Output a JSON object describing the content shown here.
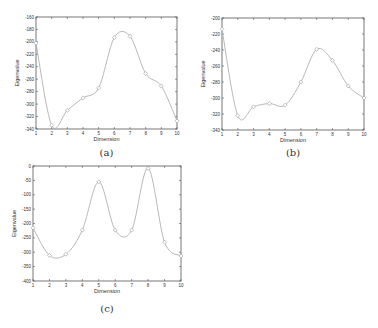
{
  "chart_data": [
    {
      "id": "a",
      "type": "line",
      "caption": "(a)",
      "title": "",
      "xlabel": "Dimension",
      "ylabel": "Eigenvalue",
      "x": [
        1,
        2,
        3,
        4,
        5,
        6,
        7,
        8,
        9,
        10
      ],
      "values": [
        -202,
        -334,
        -310,
        -290,
        -274,
        -193,
        -191,
        -251,
        -271,
        -327
      ],
      "xlim": [
        1,
        10
      ],
      "ylim": [
        -340,
        -160
      ],
      "xticks": [
        1,
        2,
        3,
        4,
        5,
        6,
        7,
        8,
        9,
        10
      ],
      "yticks": [
        -160,
        -180,
        -200,
        -220,
        -240,
        -260,
        -280,
        -300,
        -320,
        -340
      ],
      "grid": false,
      "smooth": true,
      "marker": "diamond"
    },
    {
      "id": "b",
      "type": "line",
      "caption": "(b)",
      "title": "",
      "xlabel": "Dimension",
      "ylabel": "Eigenvalue",
      "x": [
        1,
        2,
        3,
        4,
        5,
        6,
        7,
        8,
        9,
        10
      ],
      "values": [
        -214,
        -322,
        -311,
        -307,
        -309,
        -280,
        -239,
        -253,
        -285,
        -300
      ],
      "xlim": [
        1,
        10
      ],
      "ylim": [
        -340,
        -200
      ],
      "xticks": [
        1,
        2,
        3,
        4,
        5,
        6,
        7,
        8,
        9,
        10
      ],
      "yticks": [
        -200,
        -220,
        -240,
        -260,
        -280,
        -300,
        -320,
        -340
      ],
      "grid": false,
      "smooth": true,
      "marker": "diamond"
    },
    {
      "id": "c",
      "type": "line",
      "caption": "(c)",
      "title": "",
      "xlabel": "Dimension",
      "ylabel": "Eigenvalue",
      "x": [
        1,
        2,
        3,
        4,
        5,
        6,
        7,
        8,
        9,
        10
      ],
      "values": [
        -215,
        -311,
        -307,
        -223,
        -55,
        -223,
        -223,
        -8,
        -265,
        -313
      ],
      "xlim": [
        1,
        10
      ],
      "ylim": [
        -400,
        0
      ],
      "xticks": [
        1,
        2,
        3,
        4,
        5,
        6,
        7,
        8,
        9,
        10
      ],
      "yticks": [
        0,
        -50,
        -100,
        -150,
        -200,
        -250,
        -300,
        -350,
        -400
      ],
      "grid": false,
      "smooth": true,
      "marker": "diamond"
    }
  ],
  "layout": {
    "panels": [
      {
        "left": 36,
        "top": 17,
        "right": 177,
        "bottom": 129,
        "caption_y": 156
      },
      {
        "left": 222,
        "top": 18,
        "right": 364,
        "bottom": 130,
        "caption_y": 156
      },
      {
        "left": 33,
        "top": 166,
        "right": 181,
        "bottom": 281,
        "caption_y": 312
      }
    ],
    "colors": {
      "axis": "#555555",
      "line": "#b0b0b0",
      "marker": "#999999",
      "text": "#333333"
    }
  }
}
